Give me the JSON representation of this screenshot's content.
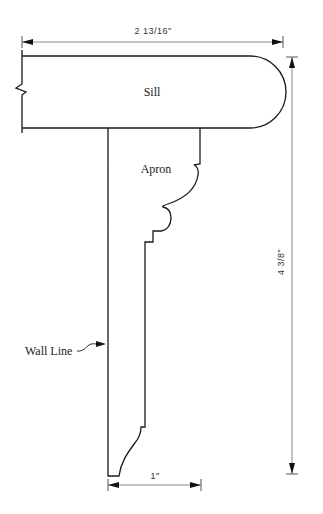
{
  "diagram": {
    "parts": {
      "sill_label": "Sill",
      "apron_label": "Apron",
      "wall_line_label": "Wall Line"
    },
    "dimensions": {
      "sill_width": "2 13/16\"",
      "overall_height": "4 3/8\"",
      "apron_thickness": "1\""
    }
  }
}
